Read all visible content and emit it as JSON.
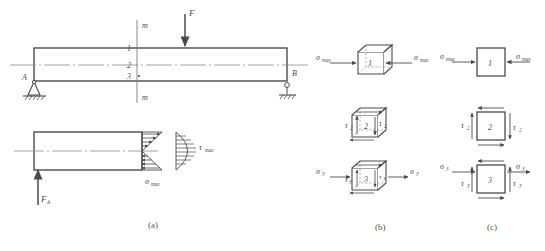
{
  "figure": {
    "captions": [
      {
        "key": "a",
        "text": "(a)"
      },
      {
        "key": "b",
        "text": "(b)"
      },
      {
        "key": "c",
        "text": "(c)"
      }
    ]
  },
  "beam": {
    "support_a_label": "A",
    "support_b_label": "B",
    "support_a_type": "pinned-support",
    "support_b_type": "roller-support",
    "load_label": "F",
    "section_label_top": "m",
    "section_label_bottom": "m",
    "point_1": "1",
    "point_2": "2",
    "point_3": "3",
    "reaction_label": "F",
    "reaction_sub": "A",
    "sigma_label": "σ",
    "sigma_sub": "max",
    "tau_label": "τ",
    "tau_sub": "max"
  },
  "elements_3d": [
    {
      "id": "1",
      "number": "1",
      "left_stress": "σ",
      "left_sub": "max",
      "right_stress": "σ",
      "right_sub": "max",
      "state": "uniaxial-compression"
    },
    {
      "id": "2",
      "number": "2",
      "left_stress": "τ",
      "left_sub": "2",
      "right_stress": "τ",
      "right_sub": "2",
      "state": "pure-shear"
    },
    {
      "id": "3",
      "number": "3",
      "left_stress": "σ",
      "left_sub": "3",
      "right_stress": "σ",
      "right_sub": "3",
      "shear_left": "τ",
      "shear_left_sub": "3",
      "shear_right": "τ",
      "shear_right_sub": "3",
      "state": "tension-plus-shear"
    }
  ],
  "elements_2d": [
    {
      "id": "1",
      "number": "1",
      "left_stress": "σ",
      "left_sub": "max",
      "right_stress": "σ",
      "right_sub": "max",
      "state": "uniaxial-compression"
    },
    {
      "id": "2",
      "number": "2",
      "left_stress": "τ",
      "left_sub": "2",
      "right_stress": "τ",
      "right_sub": "2",
      "state": "pure-shear"
    },
    {
      "id": "3",
      "number": "3",
      "left_stress": "σ",
      "left_sub": "3",
      "right_stress": "σ",
      "right_sub": "3",
      "shear_left": "τ",
      "shear_left_sub": "3",
      "shear_right": "τ",
      "shear_right_sub": "3",
      "state": "tension-plus-shear"
    }
  ],
  "colors": {
    "line": "#4a4a4a",
    "thin": "#7a7a7a",
    "background": "#ffffff"
  }
}
